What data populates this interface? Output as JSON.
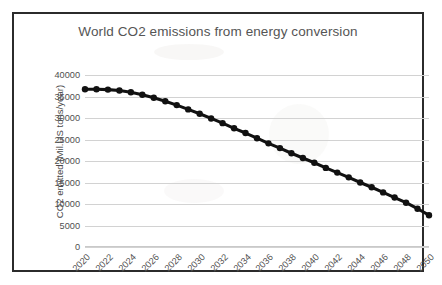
{
  "chart_data": {
    "type": "line",
    "title": "World CO2 emissions from energy conversion",
    "xlabel": "",
    "ylabel": "CO2 emitted (Mil.US tons/year)",
    "ylim": [
      0,
      40000
    ],
    "xlim": [
      2020,
      2050
    ],
    "y_ticks": [
      "40000",
      "35000",
      "30000",
      "25000",
      "20000",
      "15000",
      "10000",
      "5000",
      "0"
    ],
    "y_tick_values": [
      40000,
      35000,
      30000,
      25000,
      20000,
      15000,
      10000,
      5000,
      0
    ],
    "x_tick_labels": [
      "2020",
      "2022",
      "2024",
      "2026",
      "2028",
      "2030",
      "2032",
      "2034",
      "2036",
      "2038",
      "2040",
      "2042",
      "2044",
      "2046",
      "2048",
      "2050"
    ],
    "x_tick_values": [
      2020,
      2022,
      2024,
      2026,
      2028,
      2030,
      2032,
      2034,
      2036,
      2038,
      2040,
      2042,
      2044,
      2046,
      2048,
      2050
    ],
    "grid": true,
    "legend": false,
    "marker": "circle",
    "line_color": "#111111",
    "grid_color": "#d2d2d2",
    "title_color": "#555555",
    "x": [
      2020,
      2021,
      2022,
      2023,
      2024,
      2025,
      2026,
      2027,
      2028,
      2029,
      2030,
      2031,
      2032,
      2033,
      2034,
      2035,
      2036,
      2037,
      2038,
      2039,
      2040,
      2041,
      2042,
      2043,
      2044,
      2045,
      2046,
      2047,
      2048,
      2049,
      2050
    ],
    "values": [
      36700,
      36700,
      36600,
      36400,
      36000,
      35400,
      34700,
      33900,
      33000,
      32000,
      31000,
      29900,
      28800,
      27600,
      26500,
      25300,
      24100,
      23000,
      21800,
      20700,
      19600,
      18400,
      17300,
      16200,
      15000,
      13900,
      12700,
      11500,
      10300,
      8900,
      7400
    ],
    "series": [
      {
        "name": "World CO2 emissions",
        "values": [
          36700,
          36700,
          36600,
          36400,
          36000,
          35400,
          34700,
          33900,
          33000,
          32000,
          31000,
          29900,
          28800,
          27600,
          26500,
          25300,
          24100,
          23000,
          21800,
          20700,
          19600,
          18400,
          17300,
          16200,
          15000,
          13900,
          12700,
          11500,
          10300,
          8900,
          7400
        ]
      }
    ]
  }
}
